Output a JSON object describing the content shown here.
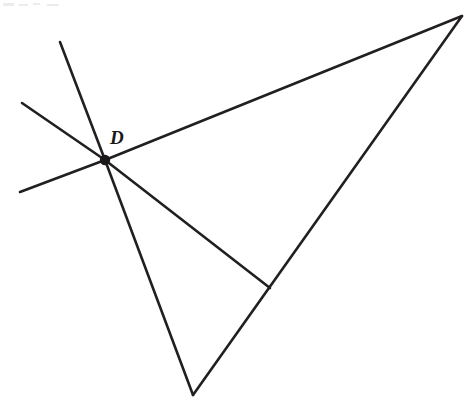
{
  "figure": {
    "background_color": "#ffffff",
    "stroke_color": "#221f20",
    "label_color": "#1b1818",
    "width": 470,
    "height": 411,
    "points": {
      "D": {
        "name": "D",
        "x": 105,
        "y": 160
      },
      "top_right": {
        "name": "",
        "x": 462,
        "y": 16
      },
      "bottom": {
        "name": "",
        "x": 193,
        "y": 395
      },
      "cevian_foot": {
        "name": "",
        "x": 270,
        "y": 288
      },
      "ray_up_steep_end": {
        "name": "",
        "x": 60,
        "y": 42
      },
      "ray_upper_left_end": {
        "name": "",
        "x": 22,
        "y": 103
      },
      "ray_lower_left_end": {
        "name": "",
        "x": 20,
        "y": 192
      }
    },
    "labels": [
      {
        "text": "D",
        "x": 110,
        "y": 144,
        "font_size": 19,
        "italic": true,
        "bold": true
      }
    ],
    "vertex_dots": [
      {
        "label": "D",
        "cx": 105,
        "cy": 160,
        "r": 5.2
      }
    ],
    "segments": [
      {
        "id": "triangle-top-edge",
        "description": "Top edge of triangle from D to upper right vertex",
        "x1": 105,
        "y1": 160,
        "x2": 462,
        "y2": 16,
        "stroke_width": 2.6
      },
      {
        "id": "triangle-right-edge",
        "description": "Right edge of triangle from upper right vertex to bottom vertex",
        "x1": 462,
        "y1": 16,
        "x2": 193,
        "y2": 395,
        "stroke_width": 2.6
      },
      {
        "id": "triangle-left-edge",
        "description": "Left edge of triangle from bottom vertex back up to D",
        "x1": 193,
        "y1": 395,
        "x2": 105,
        "y2": 160,
        "stroke_width": 2.6
      },
      {
        "id": "cevian-from-D",
        "description": "Cevian from D to foot on the right edge of the triangle",
        "x1": 105,
        "y1": 160,
        "x2": 270,
        "y2": 288,
        "stroke_width": 2.6
      },
      {
        "id": "ray-up-steep",
        "description": "Steep ray extending up and to the left from D",
        "x1": 105,
        "y1": 160,
        "x2": 60,
        "y2": 42,
        "stroke_width": 2.6
      },
      {
        "id": "ray-upper-left",
        "description": "Shallow ray extending up and to the left from D",
        "x1": 105,
        "y1": 160,
        "x2": 22,
        "y2": 103,
        "stroke_width": 2.6
      },
      {
        "id": "ray-lower-left",
        "description": "Shallow ray extending down and to the left from D",
        "x1": 105,
        "y1": 160,
        "x2": 20,
        "y2": 192,
        "stroke_width": 2.6
      }
    ],
    "scan_artifacts": [
      {
        "x": 3,
        "y": 3,
        "w": 11,
        "h": 3
      },
      {
        "x": 19,
        "y": 4,
        "w": 9,
        "h": 2
      },
      {
        "x": 33,
        "y": 3,
        "w": 7,
        "h": 2
      },
      {
        "x": 47,
        "y": 4,
        "w": 12,
        "h": 2
      }
    ]
  }
}
